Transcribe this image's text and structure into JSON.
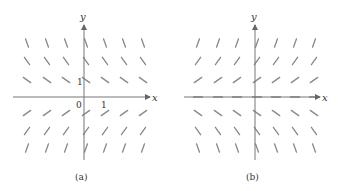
{
  "figure": {
    "panels": [
      {
        "id": "a",
        "caption": "(a)",
        "x_axis_label": "x",
        "y_axis_label": "y",
        "origin_label": "0",
        "x_tick_label": "1",
        "y_tick_label": "1",
        "description": "Slope field: negative slopes above x-axis, positive slopes below; steeper farther from axis"
      },
      {
        "id": "b",
        "caption": "(b)",
        "x_axis_label": "x",
        "y_axis_label": "y",
        "description": "Slope field: positive slopes above x-axis, zero slope on x-axis, negative slopes below; steeper farther from axis"
      }
    ],
    "colors": {
      "axis": "#777777",
      "segment": "#888888",
      "text": "#333333"
    }
  }
}
